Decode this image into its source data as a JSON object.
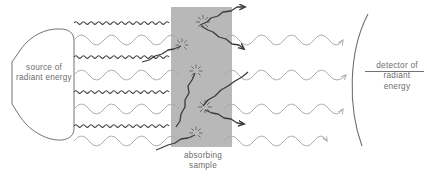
{
  "diagram": {
    "type": "schematic",
    "canvas": {
      "width": 427,
      "height": 184,
      "background": "#ffffff"
    },
    "palette": {
      "ink_dark": "#3a3a3a",
      "ink_light": "#a8a8a8",
      "outline": "#6b6b6b",
      "text": "#6d6d6d",
      "sample_fill": "#b8b8b8"
    },
    "labels": {
      "source": {
        "line1": "source of",
        "line2": "radiant energy"
      },
      "detector": {
        "line1": "detector of",
        "line2": "radiant",
        "line3": "energy"
      },
      "sample": {
        "line1": "absorbing",
        "line2": "sample"
      }
    },
    "components": {
      "source": {
        "name": "radiant-energy-source",
        "shape": "rounded-teardrop",
        "bounds": {
          "x": 6,
          "y": 28,
          "width": 70,
          "height": 112
        }
      },
      "sample": {
        "name": "absorbing-sample",
        "shape": "rectangle",
        "bounds": {
          "x": 171,
          "y": 7,
          "width": 61,
          "height": 140
        },
        "fill": "#b8b8b8"
      },
      "detector": {
        "name": "radiant-energy-detector",
        "shape": "concave-arc",
        "arc": {
          "x1": 368,
          "y1": 14,
          "x2": 362,
          "y2": 146,
          "bulge": "left"
        },
        "rule": {
          "x1": 366,
          "y1": 72,
          "x2": 424,
          "y2": 72
        }
      }
    },
    "waves": {
      "count": 8,
      "start_x": 74,
      "spacing": 17.2,
      "first_y": 23,
      "absorbed_kind": "dark-short-wavelength",
      "transmitted_kind": "light-long-wavelength",
      "rows": [
        {
          "index": 0,
          "y": 23,
          "kind": "dark",
          "wavelength": 7.5,
          "amplitude": 2.4,
          "absorbed": true
        },
        {
          "index": 1,
          "y": 40,
          "kind": "light",
          "wavelength": 30.0,
          "amplitude": 5.0,
          "absorbed": false
        },
        {
          "index": 2,
          "y": 57,
          "kind": "dark",
          "wavelength": 7.5,
          "amplitude": 2.4,
          "absorbed": true
        },
        {
          "index": 3,
          "y": 75,
          "kind": "light",
          "wavelength": 30.0,
          "amplitude": 5.0,
          "absorbed": false
        },
        {
          "index": 4,
          "y": 92,
          "kind": "dark",
          "wavelength": 7.5,
          "amplitude": 2.4,
          "absorbed": true
        },
        {
          "index": 5,
          "y": 109,
          "kind": "light",
          "wavelength": 30.0,
          "amplitude": 5.0,
          "absorbed": false
        },
        {
          "index": 6,
          "y": 126,
          "kind": "dark",
          "wavelength": 7.5,
          "amplitude": 2.4,
          "absorbed": true
        },
        {
          "index": 7,
          "y": 141,
          "kind": "light",
          "wavelength": 30.0,
          "amplitude": 5.0,
          "absorbed": false
        }
      ]
    },
    "scatter_bursts": [
      {
        "x": 203,
        "y": 22,
        "rays": 8,
        "radius": 6
      },
      {
        "x": 182,
        "y": 45,
        "rays": 7,
        "radius": 5.5
      },
      {
        "x": 196,
        "y": 71,
        "rays": 7,
        "radius": 5.5
      },
      {
        "x": 205,
        "y": 107,
        "rays": 8,
        "radius": 6
      },
      {
        "x": 196,
        "y": 133,
        "rays": 7,
        "radius": 5.5
      }
    ],
    "scattered_paths": [
      {
        "from": [
          204,
          24
        ],
        "to": [
          252,
          7
        ],
        "direction": "up-right"
      },
      {
        "from": [
          204,
          24
        ],
        "to": [
          250,
          46
        ],
        "direction": "down-right"
      },
      {
        "from": [
          183,
          46
        ],
        "to": [
          143,
          60
        ],
        "direction": "left"
      },
      {
        "from": [
          197,
          72
        ],
        "to": [
          176,
          128
        ],
        "direction": "down-left"
      },
      {
        "from": [
          206,
          108
        ],
        "to": [
          255,
          64
        ],
        "direction": "up-right"
      },
      {
        "from": [
          206,
          108
        ],
        "to": [
          250,
          120
        ],
        "direction": "right"
      },
      {
        "from": [
          197,
          134
        ],
        "to": [
          150,
          146
        ],
        "direction": "down-left"
      }
    ],
    "arrowheads": {
      "on_transmitted_waves": true,
      "count": 4,
      "target": "detector arc"
    }
  }
}
